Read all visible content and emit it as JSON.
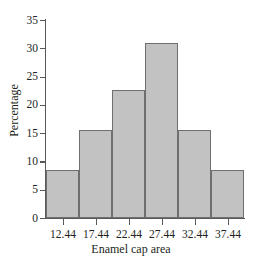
{
  "chart_data": {
    "type": "bar",
    "title": "",
    "subtitle": "",
    "xlabel": "Enamel cap area",
    "ylabel": "Percentage",
    "categories": [
      "12.44",
      "17.44",
      "22.44",
      "27.44",
      "32.44",
      "37.44"
    ],
    "values": [
      8.4,
      15.5,
      22.7,
      31.0,
      15.6,
      8.5
    ],
    "series": [
      {
        "name": "Percentage",
        "values": [
          8.4,
          15.5,
          22.7,
          31.0,
          15.6,
          8.5
        ]
      }
    ],
    "xlim": [
      9.94,
      39.94
    ],
    "ylim": [
      0,
      35
    ],
    "ytick_labels": [
      "0",
      "5",
      "10",
      "15",
      "20",
      "25",
      "30",
      "35"
    ],
    "ytick_values": [
      0,
      5,
      10,
      15,
      20,
      25,
      30,
      35
    ],
    "xtick_labels": [
      "12.44",
      "17.44",
      "22.44",
      "27.44",
      "32.44",
      "37.44"
    ],
    "bin_width": 5,
    "grid": false,
    "legend": null,
    "legend_position": "none",
    "bar_fill_color": "#c2c2c2",
    "bar_border_color": "#6e6f71",
    "axis_color": "#58595b",
    "background_color": "#ffffff",
    "annotations": []
  }
}
